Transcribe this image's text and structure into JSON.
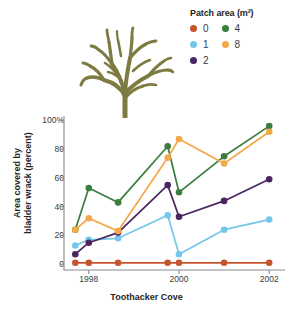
{
  "legend": {
    "title": "Patch area (m²)",
    "columns": [
      [
        {
          "label": "0",
          "color": "#c8542e"
        },
        {
          "label": "1",
          "color": "#74c6ea"
        },
        {
          "label": "2",
          "color": "#4a2560"
        }
      ],
      [
        {
          "label": "4",
          "color": "#3a7d3c"
        },
        {
          "label": "8",
          "color": "#f3a84a"
        }
      ]
    ]
  },
  "illustration": {
    "name": "bladder-wrack-seaweed",
    "color": "#7d7a42"
  },
  "chart_data": {
    "type": "line",
    "title": "",
    "xlabel": "Toothacker Cove",
    "ylabel": "Area covered by bladder wrack (percent)",
    "ylabel_line1": "Area covered by",
    "ylabel_line2": "bladder wrack (percent)",
    "x": [
      1997.7,
      1998.0,
      1998.65,
      1999.75,
      2000.0,
      2001.0,
      2002.0
    ],
    "xticks": [
      1998,
      2000,
      2002
    ],
    "xtick_labels": [
      "1998",
      "2000",
      "2002"
    ],
    "xlim": [
      1997.45,
      2002.35
    ],
    "yticks": [
      0,
      20,
      40,
      60,
      80,
      100
    ],
    "ytick_labels": [
      "0",
      "20",
      "40",
      "60",
      "80",
      "100%"
    ],
    "ylim": [
      -4,
      103
    ],
    "grid": false,
    "legend_position": "top-right",
    "series": [
      {
        "name": "0",
        "color": "#c8542e",
        "values": [
          1,
          1,
          1,
          1,
          1,
          1,
          1
        ]
      },
      {
        "name": "1",
        "color": "#74c6ea",
        "values": [
          13,
          17,
          18,
          34,
          7,
          24,
          31
        ]
      },
      {
        "name": "2",
        "color": "#4a2560",
        "values": [
          7,
          15,
          22,
          55,
          33,
          44,
          59
        ]
      },
      {
        "name": "4",
        "color": "#3a7d3c",
        "values": [
          24,
          53,
          43,
          82,
          50,
          75,
          96
        ]
      },
      {
        "name": "8",
        "color": "#f3a84a",
        "values": [
          24,
          32,
          23,
          74,
          87,
          70,
          92
        ]
      }
    ]
  }
}
